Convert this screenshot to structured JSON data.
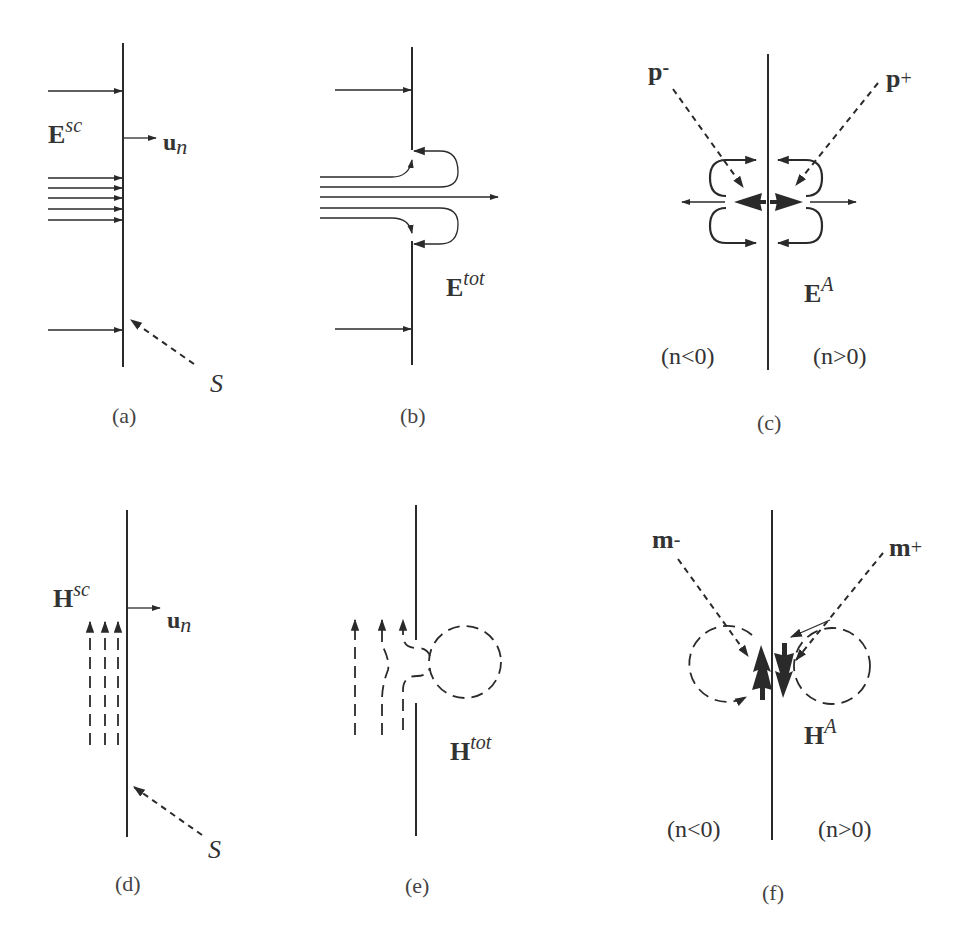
{
  "figure": {
    "panels": [
      {
        "id": "a",
        "caption": "(a)",
        "field_label": {
          "main": "E",
          "sup": "sc"
        },
        "normal_label": {
          "main": "u",
          "sub": "n"
        },
        "surface_label": "S"
      },
      {
        "id": "b",
        "caption": "(b)",
        "field_label": {
          "main": "E",
          "sup": "tot"
        }
      },
      {
        "id": "c",
        "caption": "(c)",
        "field_label": {
          "main": "E",
          "sup": "A"
        },
        "dipole_left": {
          "main": "p",
          "sub": "-"
        },
        "dipole_right": {
          "main": "p",
          "sub": "+"
        },
        "region_left": "(n<0)",
        "region_right": "(n>0)"
      },
      {
        "id": "d",
        "caption": "(d)",
        "field_label": {
          "main": "H",
          "sup": "sc"
        },
        "normal_label": {
          "main": "u",
          "sub": "n"
        },
        "surface_label": "S"
      },
      {
        "id": "e",
        "caption": "(e)",
        "field_label": {
          "main": "H",
          "sup": "tot"
        }
      },
      {
        "id": "f",
        "caption": "(f)",
        "field_label": {
          "main": "H",
          "sup": "A"
        },
        "dipole_left": {
          "main": "m",
          "sub": "-"
        },
        "dipole_right": {
          "main": "m",
          "sub": "+"
        },
        "region_left": "(n<0)",
        "region_right": "(n>0)"
      }
    ],
    "colors": {
      "ink": "#2a2a2a",
      "text": "#333333",
      "background": "#ffffff"
    }
  }
}
